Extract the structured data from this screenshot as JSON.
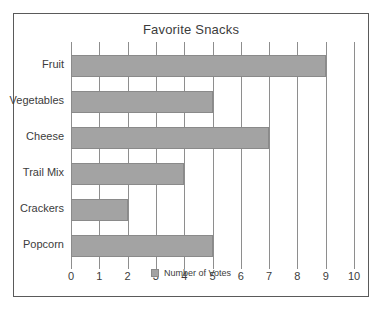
{
  "chart_data": {
    "type": "bar",
    "orientation": "horizontal",
    "title": "Favorite Snacks",
    "xlabel": "",
    "ylabel": "",
    "xlim": [
      0,
      10
    ],
    "xticks": [
      "0",
      "1",
      "2",
      "3",
      "4",
      "5",
      "6",
      "7",
      "8",
      "9",
      "10"
    ],
    "grid": true,
    "legend_position": "bottom",
    "categories": [
      "Fruit",
      "Vegetables",
      "Cheese",
      "Trail Mix",
      "Crackers",
      "Popcorn"
    ],
    "series": [
      {
        "name": "Number of Votes",
        "values": [
          9,
          5,
          7,
          4,
          2,
          5
        ],
        "color": "#a3a3a3"
      }
    ]
  },
  "legend": {
    "label": "Number of Votes",
    "swatch_color": "#a3a3a3"
  },
  "colors": {
    "bar": "#a3a3a3",
    "bar_border": "#8a8a8a",
    "grid": "#8e8e8e",
    "frame": "#5a5a5a",
    "text": "#3c3c3c"
  }
}
